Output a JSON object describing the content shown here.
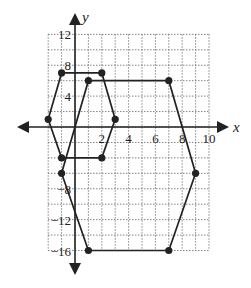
{
  "chart_data": {
    "type": "scatter",
    "title": "",
    "xlabel": "x",
    "ylabel": "y",
    "xlim": [
      -2,
      10
    ],
    "ylim": [
      -16,
      12
    ],
    "grid": true,
    "x_ticks": [
      "2",
      "4",
      "6",
      "8",
      "10"
    ],
    "y_ticks": [
      "12",
      "8",
      "4",
      "-8",
      "-12",
      "-16"
    ],
    "series": [
      {
        "name": "small hexagon",
        "closed": true,
        "points": [
          [
            -1,
            7
          ],
          [
            2,
            7
          ],
          [
            3,
            1
          ],
          [
            2,
            -4
          ],
          [
            -1,
            -4
          ],
          [
            -2,
            1
          ]
        ]
      },
      {
        "name": "large hexagon",
        "closed": true,
        "points": [
          [
            1,
            6
          ],
          [
            7,
            6
          ],
          [
            9,
            -6
          ],
          [
            7,
            -16
          ],
          [
            1,
            -16
          ],
          [
            -1,
            -6
          ]
        ]
      }
    ]
  },
  "colors": {
    "line": "#222222",
    "grid": "#666666"
  }
}
